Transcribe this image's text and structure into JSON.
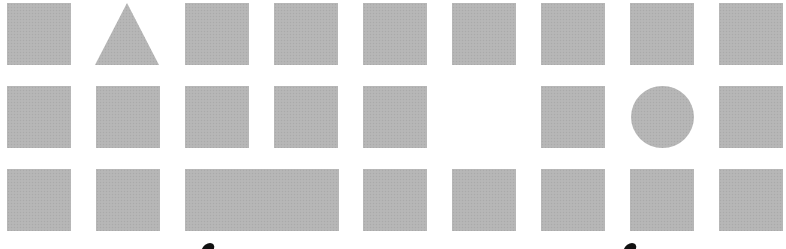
{
  "figure": {
    "fill_color": "#b5b5b5",
    "background_color": "#ffffff",
    "rows": [
      {
        "cells": [
          {
            "shape": "square",
            "x": 7,
            "y": 3,
            "w": 64,
            "h": 62
          },
          {
            "shape": "triangle",
            "x": 95,
            "y": 3,
            "w": 64,
            "h": 62
          },
          {
            "shape": "square",
            "x": 185,
            "y": 3,
            "w": 64,
            "h": 62
          },
          {
            "shape": "square",
            "x": 274,
            "y": 3,
            "w": 64,
            "h": 62
          },
          {
            "shape": "square",
            "x": 363,
            "y": 3,
            "w": 64,
            "h": 62
          },
          {
            "shape": "square",
            "x": 452,
            "y": 3,
            "w": 64,
            "h": 62
          },
          {
            "shape": "square",
            "x": 541,
            "y": 3,
            "w": 64,
            "h": 62
          },
          {
            "shape": "square",
            "x": 630,
            "y": 3,
            "w": 64,
            "h": 62
          },
          {
            "shape": "square",
            "x": 719,
            "y": 3,
            "w": 64,
            "h": 62
          }
        ]
      },
      {
        "cells": [
          {
            "shape": "square",
            "x": 7,
            "y": 86,
            "w": 64,
            "h": 62
          },
          {
            "shape": "square",
            "x": 96,
            "y": 86,
            "w": 64,
            "h": 62
          },
          {
            "shape": "square",
            "x": 185,
            "y": 86,
            "w": 64,
            "h": 62
          },
          {
            "shape": "square",
            "x": 274,
            "y": 86,
            "w": 64,
            "h": 62
          },
          {
            "shape": "square",
            "x": 363,
            "y": 86,
            "w": 64,
            "h": 62
          },
          {
            "shape": "empty"
          },
          {
            "shape": "square",
            "x": 541,
            "y": 86,
            "w": 64,
            "h": 62
          },
          {
            "shape": "circle",
            "x": 631,
            "y": 86,
            "w": 63,
            "h": 62
          },
          {
            "shape": "square",
            "x": 719,
            "y": 86,
            "w": 64,
            "h": 62
          }
        ]
      },
      {
        "cells": [
          {
            "shape": "square",
            "x": 7,
            "y": 169,
            "w": 64,
            "h": 62
          },
          {
            "shape": "square",
            "x": 96,
            "y": 169,
            "w": 64,
            "h": 62
          },
          {
            "shape": "wide-rectangle",
            "x": 185,
            "y": 169,
            "w": 154,
            "h": 62
          },
          {
            "shape": "square",
            "x": 363,
            "y": 169,
            "w": 64,
            "h": 62
          },
          {
            "shape": "square",
            "x": 452,
            "y": 169,
            "w": 64,
            "h": 62
          },
          {
            "shape": "square",
            "x": 541,
            "y": 169,
            "w": 64,
            "h": 62
          },
          {
            "shape": "square",
            "x": 630,
            "y": 169,
            "w": 64,
            "h": 62
          },
          {
            "shape": "square",
            "x": 719,
            "y": 169,
            "w": 64,
            "h": 62
          }
        ]
      }
    ],
    "partial_glyphs": [
      {
        "x": 203,
        "y": 243
      },
      {
        "x": 625,
        "y": 243
      }
    ]
  }
}
